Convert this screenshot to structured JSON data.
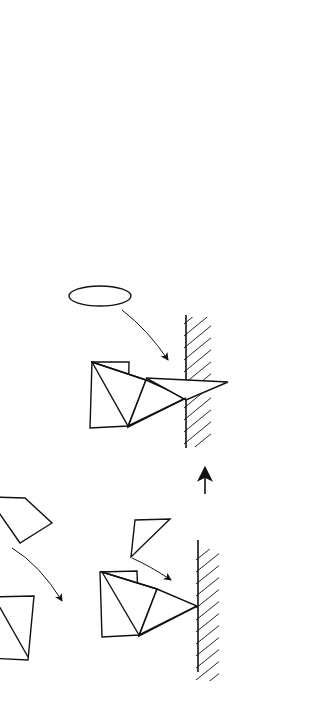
{
  "figure": {
    "orientation_note": "rotated-90-ccw",
    "background_color": "#ffffff",
    "ink_color": "#111111"
  },
  "panels": [
    {
      "id": "panel-stage-1",
      "name": "initial-binding",
      "labels": {
        "membrane": "Cell Membrane",
        "c5b": "C",
        "c5b_sub": "5b",
        "c6": "C",
        "c6_sub": "6",
        "c7": "C",
        "c7_sub": "7",
        "c8": "C",
        "c8_sub": "8"
      }
    },
    {
      "id": "panel-stage-2",
      "name": "c9-recruitment",
      "labels": {
        "c5b": "C",
        "c5b_sub": "5b",
        "c6": "C",
        "c6_sub": "6",
        "c7": "C",
        "c7_sub": "7",
        "c8": "C",
        "c8_sub": "8",
        "c9": "C",
        "c9_sub": "9"
      }
    },
    {
      "id": "panel-stage-3",
      "name": "pore-formation",
      "labels": {
        "transmembrane_line1": "Transmembrane",
        "transmembrane_line2": "Channel",
        "polymerized_line1": "Polymerized",
        "polymerized_c": "C",
        "polymerized_sub": "9",
        "c5_8": "C",
        "c5_8_sub": "5-8"
      }
    }
  ],
  "arrows": {
    "stage1_to_stage2": "up-arrow",
    "stage2_to_stage3": "up-arrow",
    "c8_binding": "curved-arrow",
    "c9_binding": "curved-arrow",
    "c7_binding": "curved-arrow",
    "channel_pointer": "curved-leader-line",
    "channel_flow": "inward-arrow"
  },
  "colors": {
    "ink": "#111111",
    "paper": "#ffffff"
  }
}
